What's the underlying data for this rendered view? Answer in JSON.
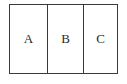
{
  "diagram": {
    "type": "partitioned-rectangle",
    "title": "",
    "background_color": "#ffffff",
    "border_color": "#3a3a3a",
    "label_color": "#2b2b2b",
    "cells": [
      {
        "label": "A",
        "name": "cell-a"
      },
      {
        "label": "B",
        "name": "cell-b"
      },
      {
        "label": "C",
        "name": "cell-c"
      }
    ]
  }
}
